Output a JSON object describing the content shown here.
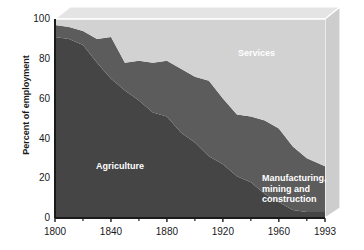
{
  "chart_data": {
    "type": "area",
    "stacked": true,
    "title": "",
    "xlabel": "",
    "ylabel": "Percent of employment",
    "xlim": [
      1800,
      1993
    ],
    "ylim": [
      0,
      100
    ],
    "grid": false,
    "legend_position": "inline-labels",
    "x_ticks": [
      "1800",
      "1840",
      "1880",
      "1920",
      "1960",
      "1993"
    ],
    "x_tick_values": [
      1800,
      1840,
      1880,
      1920,
      1960,
      1993
    ],
    "y_ticks": [
      "0",
      "20",
      "40",
      "60",
      "80",
      "100"
    ],
    "y_tick_values": [
      0,
      20,
      40,
      60,
      80,
      100
    ],
    "x": [
      1800,
      1810,
      1820,
      1830,
      1840,
      1850,
      1860,
      1870,
      1880,
      1890,
      1900,
      1910,
      1920,
      1930,
      1940,
      1950,
      1960,
      1970,
      1980,
      1993
    ],
    "series": [
      {
        "name": "Agriculture",
        "color": "#454545",
        "values": [
          91,
          90,
          87,
          78,
          70,
          64,
          59,
          53,
          51,
          43,
          38,
          31,
          27,
          21,
          18,
          12,
          8,
          4,
          3,
          3
        ]
      },
      {
        "name": "Manufacturing, mining and construction",
        "color": "#5c5c5c",
        "values": [
          6,
          6,
          7,
          12,
          21,
          14,
          20,
          25,
          28,
          32,
          33,
          38,
          33,
          31,
          33,
          37,
          37,
          32,
          27,
          23
        ]
      },
      {
        "name": "Services",
        "color": "#d2d2d2",
        "values": [
          3,
          4,
          6,
          10,
          9,
          22,
          21,
          22,
          21,
          25,
          29,
          31,
          40,
          48,
          49,
          51,
          55,
          64,
          70,
          74
        ]
      }
    ],
    "labels": {
      "services": "Services",
      "agriculture": "Agriculture",
      "manufacturing": "Manufacturing,\nmining and\nconstruction"
    },
    "colors": {
      "agriculture": "#454545",
      "manufacturing": "#5c5c5c",
      "services": "#d2d2d2",
      "box_top": "#e2e2e2",
      "box_side": "#cfcfcf",
      "box_edge": "#ffffff",
      "axis": "#1a1a1a",
      "background": "#ffffff"
    }
  }
}
